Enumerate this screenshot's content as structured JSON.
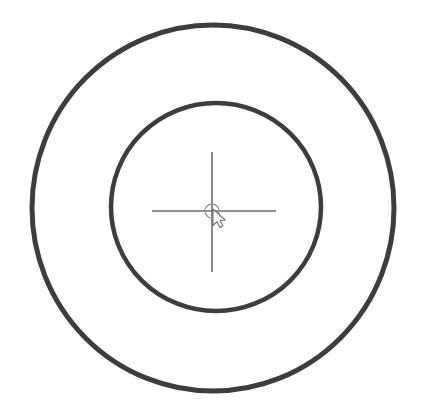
{
  "canvas": {
    "width": 421,
    "height": 418,
    "background_color": "#ffffff",
    "title": "Concentric circles target with crosshair and mouse cursor"
  },
  "palette": {
    "ring_stroke": "#3d3d3d",
    "ring_stroke_soft": "#4a4a4a",
    "crosshair_stroke": "#6b6b6b",
    "center_ring_stroke": "#9a9a9a",
    "cursor_stroke": "#707070",
    "cursor_fill": "#ffffff",
    "background": "#ffffff"
  },
  "shapes": {
    "outer_circle": {
      "name": "outer-circle",
      "cx": 213,
      "cy": 208,
      "rx": 181,
      "ry": 183,
      "stroke_width": 5,
      "stroke_color": "#3d3d3d",
      "fill": "none"
    },
    "inner_circle": {
      "name": "inner-circle",
      "cx": 216,
      "cy": 207,
      "rx": 105,
      "ry": 104,
      "stroke_width": 4.5,
      "stroke_color": "#3d3d3d",
      "fill": "none"
    },
    "center_ring": {
      "name": "center-ring",
      "cx": 212,
      "cy": 211,
      "r": 7,
      "stroke_width": 1.4,
      "stroke_color": "#9a9a9a",
      "fill": "none"
    }
  },
  "crosshair": {
    "name": "crosshair",
    "stroke_color": "#6b6b6b",
    "stroke_width": 1.6,
    "horizontal": {
      "x1": 152,
      "y1": 211,
      "x2": 276,
      "y2": 211
    },
    "vertical": {
      "x1": 212,
      "y1": 152,
      "x2": 212,
      "y2": 272
    }
  },
  "cursor": {
    "name": "mouse-cursor",
    "type": "arrow-pointer",
    "tip_x": 213,
    "tip_y": 209,
    "stroke_color": "#707070",
    "fill_color": "#ffffff",
    "stroke_width": 1.1,
    "scale": 1.0
  },
  "labels": {
    "scene_description": "Two concentric dark circles on a white background",
    "outer_circle_label": "Outer circle",
    "inner_circle_label": "Inner circle",
    "crosshair_label": "Crosshair",
    "center_ring_label": "Center ring",
    "cursor_label": "Mouse pointer"
  },
  "chart_data": {
    "type": "scatter",
    "xlabel": "",
    "ylabel": "",
    "xlim": [
      0,
      421
    ],
    "ylim": [
      0,
      418
    ],
    "grid": false,
    "legend": "none",
    "annotations": [
      "Outer circle: center (213, 208), radius ~182 px, stroke ~5 px, color #3d3d3d",
      "Inner circle: center (216, 207), radius ~105 px, stroke ~4.5 px, color #3d3d3d",
      "Crosshair horizontal line from x=152 to x=276 at y=211",
      "Crosshair vertical line from y=152 to y=272 at x=212",
      "Small center ring radius ~7 px at (212, 211)",
      "Arrow mouse pointer with tip at (213, 209)"
    ],
    "series": [
      {
        "name": "outer-circle",
        "values": [
          213,
          208,
          182
        ]
      },
      {
        "name": "inner-circle",
        "values": [
          216,
          207,
          105
        ]
      },
      {
        "name": "center-ring",
        "values": [
          212,
          211,
          7
        ]
      }
    ]
  }
}
